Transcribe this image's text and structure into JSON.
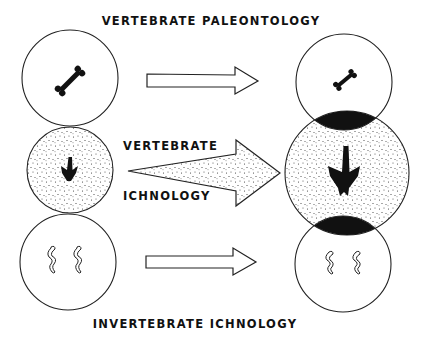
{
  "diagram": {
    "top_label": "VERTEBRATE PALEONTOLOGY",
    "middle_label_line1": "VERTEBRATE",
    "middle_label_line2": "ICHNOLOGY",
    "bottom_label": "INVERTEBRATE ICHNOLOGY",
    "left_column": [
      {
        "id": "vertebrate-paleontology",
        "content": "bone-icon",
        "fill": "white"
      },
      {
        "id": "vertebrate-ichnology",
        "content": "footprint-icon",
        "fill": "stippled"
      },
      {
        "id": "invertebrate-ichnology",
        "content": "burrow-icons",
        "fill": "white"
      }
    ],
    "right_column": [
      {
        "id": "vertebrate-paleontology",
        "content": "bone-icon",
        "fill": "white"
      },
      {
        "id": "vertebrate-ichnology",
        "content": "footprint-icon",
        "fill": "stippled",
        "enlarged": true
      },
      {
        "id": "invertebrate-ichnology",
        "content": "burrow-icons",
        "fill": "white"
      }
    ],
    "arrows": [
      {
        "from": "vertebrate-paleontology",
        "style": "outline"
      },
      {
        "from": "vertebrate-ichnology",
        "style": "stippled-wedge"
      },
      {
        "from": "invertebrate-ichnology",
        "style": "outline"
      }
    ],
    "colors": {
      "ink": "#111111",
      "background": "#ffffff"
    }
  }
}
